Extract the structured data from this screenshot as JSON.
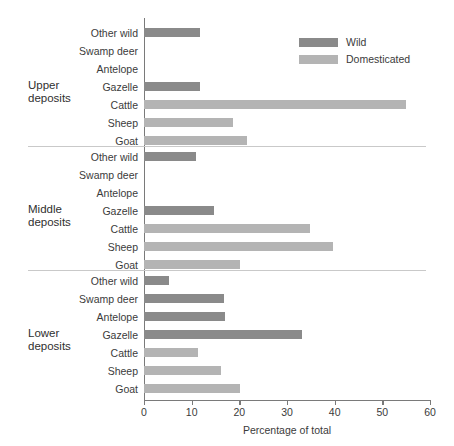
{
  "chart_data": {
    "type": "bar",
    "orientation": "horizontal",
    "title": "",
    "xlabel": "Percentage of total",
    "ylabel": "",
    "xlim": [
      0,
      60
    ],
    "xticks": [
      0,
      10,
      20,
      30,
      40,
      50,
      60
    ],
    "grid": false,
    "legend": {
      "position": "top-right",
      "entries": [
        {
          "name": "Wild",
          "color": "#8a8a8a"
        },
        {
          "name": "Domesticated",
          "color": "#b4b4b4"
        }
      ]
    },
    "categories": [
      "Other wild",
      "Swamp deer",
      "Antelope",
      "Gazelle",
      "Cattle",
      "Sheep",
      "Goat"
    ],
    "category_types": [
      "wild",
      "wild",
      "wild",
      "wild",
      "dom",
      "dom",
      "dom"
    ],
    "groups": [
      {
        "name": "Upper deposits",
        "label_line1": "Upper",
        "label_line2": "deposits",
        "values": [
          11.8,
          0,
          0,
          11.8,
          55.0,
          18.6,
          21.6
        ]
      },
      {
        "name": "Middle deposits",
        "label_line1": "Middle",
        "label_line2": "deposits",
        "values": [
          11.0,
          0,
          0,
          14.7,
          34.8,
          39.7,
          20.1
        ]
      },
      {
        "name": "Lower deposits",
        "label_line1": "Lower",
        "label_line2": "deposits",
        "values": [
          5.2,
          16.8,
          17.0,
          33.1,
          11.3,
          16.1,
          20.1
        ]
      }
    ]
  },
  "axis": {
    "x_title": "Percentage of total",
    "tick_labels": [
      "0",
      "10",
      "20",
      "30",
      "40",
      "50",
      "60"
    ]
  },
  "colors": {
    "wild": "#8a8a8a",
    "domesticated": "#b4b4b4",
    "axis": "#7a7a7a",
    "divider": "#c9c9c9",
    "text": "#3b3b3b",
    "background": "#ffffff"
  }
}
